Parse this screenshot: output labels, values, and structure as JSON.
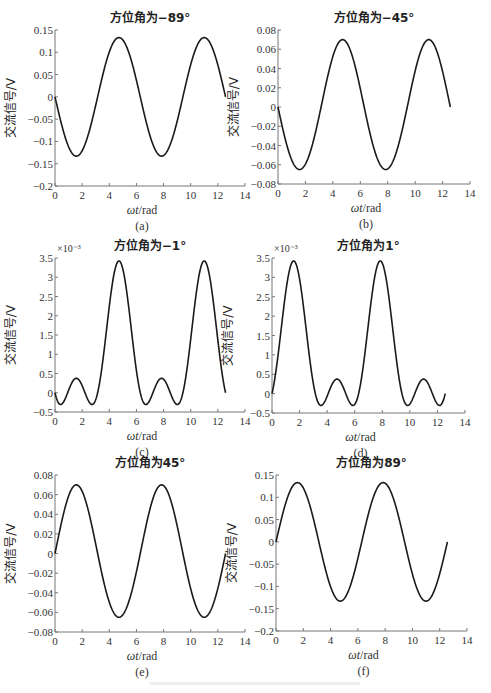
{
  "figure": {
    "caption": ""
  },
  "chart_data": [
    {
      "id": "a",
      "type": "line",
      "title": "方位角为−89°",
      "xlabel": "ωt/rad",
      "ylabel": "交流信号/V",
      "sublabel": "(a)",
      "xlim": [
        0,
        14
      ],
      "ylim": [
        -0.2,
        0.15
      ],
      "xticks": [
        0,
        2,
        4,
        6,
        8,
        10,
        12,
        14
      ],
      "yticks": [
        -0.2,
        -0.15,
        -0.1,
        -0.05,
        0,
        0.05,
        0.1,
        0.15
      ],
      "ytick_labels": [
        "−0.2",
        "−0.15",
        "−0.1",
        "−0.05",
        "0",
        "0.05",
        "0.1",
        "0.15"
      ],
      "exponent": "",
      "x_range": [
        0,
        12.566
      ],
      "formula": "-A*sin(x)",
      "amplitude": 0.133,
      "series": [
        {
          "name": "signal",
          "x": [
            0,
            1.571,
            3.142,
            4.712,
            6.283,
            7.854,
            9.425,
            10.996,
            12.566
          ],
          "values": [
            0,
            -0.13,
            0,
            0.135,
            0,
            -0.13,
            0,
            0.135,
            0
          ]
        }
      ],
      "grid": false
    },
    {
      "id": "b",
      "type": "line",
      "title": "方位角为−45°",
      "xlabel": "ωt/rad",
      "ylabel": "交流信号/V",
      "sublabel": "(b)",
      "xlim": [
        0,
        14
      ],
      "ylim": [
        -0.08,
        0.08
      ],
      "xticks": [
        0,
        2,
        4,
        6,
        8,
        10,
        12,
        14
      ],
      "yticks": [
        -0.08,
        -0.06,
        -0.04,
        -0.02,
        0,
        0.02,
        0.04,
        0.06,
        0.08
      ],
      "ytick_labels": [
        "−0.08",
        "−0.06",
        "−0.04",
        "−0.02",
        "0",
        "0.02",
        "0.04",
        "0.06",
        "0.08"
      ],
      "exponent": "",
      "x_range": [
        0,
        12.566
      ],
      "formula": "-A*sin(x)+B*(1-cos(2x))/2",
      "amplitude": 0.0675,
      "offset2": 0.0025,
      "series": [
        {
          "name": "signal",
          "x": [
            0,
            1.571,
            3.142,
            4.712,
            6.283,
            7.854,
            9.425,
            10.996,
            12.566
          ],
          "values": [
            0,
            -0.065,
            0,
            0.07,
            0,
            -0.065,
            0,
            0.07,
            0
          ]
        }
      ],
      "grid": false
    },
    {
      "id": "c",
      "type": "line",
      "title": "方位角为−1°",
      "xlabel": "ωt/rad",
      "ylabel": "交流信号/V",
      "sublabel": "(c)",
      "xlim": [
        0,
        14
      ],
      "ylim": [
        -0.5,
        3.5
      ],
      "xticks": [
        0,
        2,
        4,
        6,
        8,
        10,
        12,
        14
      ],
      "yticks": [
        -0.5,
        0,
        0.5,
        1,
        1.5,
        2,
        2.5,
        3,
        3.5
      ],
      "ytick_labels": [
        "−0.5",
        "0",
        "0.5",
        "1",
        "1.5",
        "2",
        "2.5",
        "3",
        "3.5"
      ],
      "exponent": "×10⁻³",
      "x_range": [
        0,
        12.566
      ],
      "formula": "-A*sin(x)+B*(1-cos(2x))/2",
      "amplitude": 1.525,
      "offset2": 1.9,
      "series": [
        {
          "name": "signal",
          "x": [
            0,
            0.6,
            1.571,
            2.6,
            4.712,
            6.7,
            7.854,
            9.0,
            10.996,
            12.566
          ],
          "values": [
            0,
            -0.3,
            0.38,
            -0.3,
            3.42,
            -0.3,
            0.38,
            -0.3,
            3.42,
            0
          ]
        }
      ],
      "grid": false
    },
    {
      "id": "d",
      "type": "line",
      "title": "方位角为1°",
      "xlabel": "ωt/rad",
      "ylabel": "交流信号/V",
      "sublabel": "(d)",
      "xlim": [
        0,
        14
      ],
      "ylim": [
        -0.5,
        3.5
      ],
      "xticks": [
        0,
        2,
        4,
        6,
        8,
        10,
        12,
        14
      ],
      "yticks": [
        -0.5,
        0,
        0.5,
        1,
        1.5,
        2,
        2.5,
        3,
        3.5
      ],
      "ytick_labels": [
        "−0.5",
        "0",
        "0.5",
        "1",
        "1.5",
        "2",
        "2.5",
        "3",
        "3.5"
      ],
      "exponent": "×10⁻³",
      "x_range": [
        0,
        12.566
      ],
      "formula": "A*sin(x)+B*(1-cos(2x))/2",
      "amplitude": 1.525,
      "offset2": 1.9,
      "series": [
        {
          "name": "signal",
          "x": [
            0,
            1.571,
            3.6,
            4.712,
            5.8,
            7.854,
            9.8,
            10.996,
            12.1,
            12.566
          ],
          "values": [
            0,
            3.42,
            -0.3,
            0.38,
            -0.3,
            3.42,
            -0.3,
            0.38,
            -0.3,
            0
          ]
        }
      ],
      "grid": false
    },
    {
      "id": "e",
      "type": "line",
      "title": "方位角为45°",
      "xlabel": "ωt/rad",
      "ylabel": "交流信号/V",
      "sublabel": "(e)",
      "xlim": [
        0,
        14
      ],
      "ylim": [
        -0.08,
        0.08
      ],
      "xticks": [
        0,
        2,
        4,
        6,
        8,
        10,
        12,
        14
      ],
      "yticks": [
        -0.08,
        -0.06,
        -0.04,
        -0.02,
        0,
        0.02,
        0.04,
        0.06,
        0.08
      ],
      "ytick_labels": [
        "−0.08",
        "−0.06",
        "−0.04",
        "−0.02",
        "0",
        "0.02",
        "0.04",
        "0.06",
        "0.08"
      ],
      "exponent": "",
      "x_range": [
        0,
        12.566
      ],
      "formula": "A*sin(x)+B*(1-cos(2x))/2",
      "amplitude": 0.0675,
      "offset2": 0.0025,
      "series": [
        {
          "name": "signal",
          "x": [
            0,
            1.571,
            3.142,
            4.712,
            6.283,
            7.854,
            9.425,
            10.996,
            12.566
          ],
          "values": [
            0,
            0.07,
            0,
            -0.065,
            0,
            0.07,
            0,
            -0.065,
            0
          ]
        }
      ],
      "grid": false
    },
    {
      "id": "f",
      "type": "line",
      "title": "方位角为89°",
      "xlabel": "ωt/rad",
      "ylabel": "交流信号/V",
      "sublabel": "(f)",
      "xlim": [
        0,
        14
      ],
      "ylim": [
        -0.2,
        0.15
      ],
      "xticks": [
        0,
        2,
        4,
        6,
        8,
        10,
        12,
        14
      ],
      "yticks": [
        -0.2,
        -0.15,
        -0.1,
        -0.05,
        0,
        0.05,
        0.1,
        0.15
      ],
      "ytick_labels": [
        "−0.2",
        "−0.15",
        "−0.1",
        "−0.05",
        "0",
        "0.05",
        "0.1",
        "0.15"
      ],
      "exponent": "",
      "x_range": [
        0,
        12.566
      ],
      "formula": "A*sin(x)",
      "amplitude": 0.133,
      "series": [
        {
          "name": "signal",
          "x": [
            0,
            1.571,
            3.142,
            4.712,
            6.283,
            7.854,
            9.425,
            10.996,
            12.566
          ],
          "values": [
            0,
            0.135,
            0,
            -0.13,
            0,
            0.135,
            0,
            -0.13,
            0
          ]
        }
      ],
      "grid": false
    }
  ]
}
